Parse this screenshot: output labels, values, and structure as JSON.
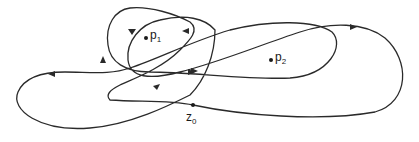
{
  "diagram": {
    "type": "closed-curve-winding",
    "points": [
      {
        "id": "p1",
        "name": "p",
        "subscript": "1",
        "x": 146,
        "y": 38
      },
      {
        "id": "p2",
        "name": "p",
        "subscript": "2",
        "x": 271,
        "y": 60
      },
      {
        "id": "z0",
        "name": "z",
        "subscript": "0",
        "x": 193,
        "y": 105
      }
    ],
    "colors": {
      "stroke": "#2a2a2a",
      "background": "#ffffff"
    }
  }
}
